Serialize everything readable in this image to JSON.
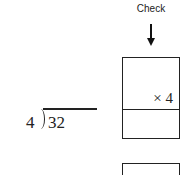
{
  "check": {
    "label": "Check",
    "arrow_icon": "down-arrow"
  },
  "check_box": {
    "multiplier": "× 4",
    "top_cell": "",
    "bottom_cell": ""
  },
  "division": {
    "divisor": "4",
    "dividend": "32",
    "quotient": ""
  },
  "next_box": {
    "content": ""
  }
}
